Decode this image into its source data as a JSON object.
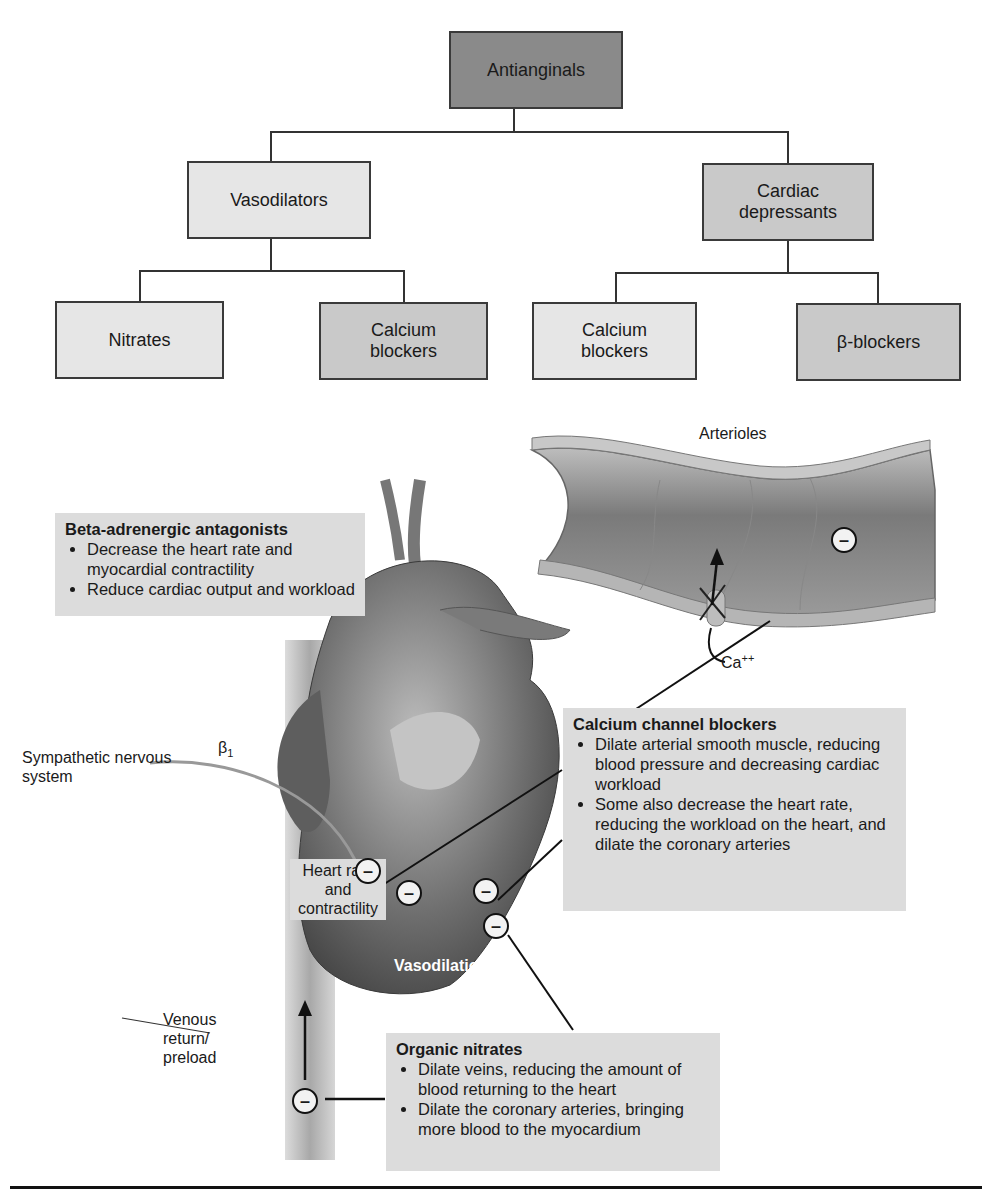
{
  "tree": {
    "root": "Antianginals",
    "level1": [
      "Vasodilators",
      "Cardiac depressants"
    ],
    "level2": [
      "Nitrates",
      "Calcium blockers",
      "Calcium blockers",
      "β-blockers"
    ]
  },
  "labels": {
    "arterioles": "Arterioles",
    "calcium_ion": "Ca",
    "calcium_charge": "++",
    "beta1": "β",
    "beta1_sub": "1",
    "sympathetic": "Sympathetic nervous system",
    "heart_rate": "Heart rate and contractility",
    "vasodilation": "Vasodilation",
    "venous": "Venous return/ preload",
    "minus_symbol": "–"
  },
  "info_boxes": {
    "beta": {
      "title": "Beta-adrenergic antagonists",
      "bullets": [
        "Decrease the heart rate and myocardial contractility",
        "Reduce cardiac output and workload"
      ]
    },
    "calcium": {
      "title": "Calcium channel blockers",
      "bullets": [
        "Dilate arterial smooth muscle, reducing blood pressure and decreasing cardiac workload",
        "Some also decrease the heart rate, reducing the workload on the heart, and dilate the coronary arteries"
      ]
    },
    "nitrates": {
      "title": "Organic nitrates",
      "bullets": [
        "Dilate veins, reducing the amount of blood returning to the heart",
        "Dilate the coronary arteries, bringing more blood to the myocardium"
      ]
    }
  },
  "colors": {
    "root_box": "#8a8a8a",
    "mid_box": "#c9c9c9",
    "light_box": "#e6e6e6",
    "info_bg": "#dcdcdc"
  }
}
